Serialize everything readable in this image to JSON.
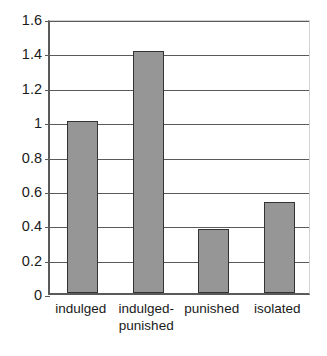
{
  "chart_data": {
    "type": "bar",
    "title": "",
    "subtitle": "",
    "xlabel": "",
    "ylabel": "",
    "categories": [
      "indulged",
      "indulged-\npunished",
      "punished",
      "isolated"
    ],
    "category_labels_flat": [
      "indulged",
      "indulged-punished",
      "punished",
      "isolated"
    ],
    "values": [
      1.0,
      1.41,
      0.37,
      0.53
    ],
    "ylim": [
      0,
      1.6
    ],
    "yticks": [
      0,
      0.2,
      0.4,
      0.6,
      0.8,
      1.0,
      1.2,
      1.4,
      1.6
    ],
    "ytick_labels": [
      "0",
      "0.2",
      "0.4",
      "0.6",
      "0.8",
      "1",
      "1.2",
      "1.4",
      "1.6"
    ],
    "grid": true,
    "grid_axis": "y",
    "legend": false,
    "legend_position": "none",
    "bar_fill_color": "#969696",
    "bar_edge_color": "#333333",
    "axis_color": "#5a5a5a",
    "gridline_color": "#5a5a5a",
    "background_color": "#ffffff",
    "text_color": "#1a1a1a"
  }
}
